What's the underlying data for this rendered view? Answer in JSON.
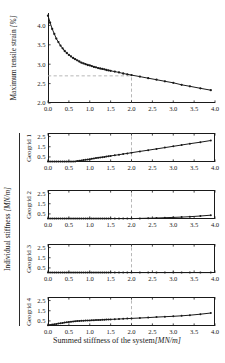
{
  "colors": {
    "axis": "#1a1a1a",
    "line": "#1a1a1a",
    "dash": "#b0b0b0",
    "text": "#1a1a1a",
    "bg": "#ffffff"
  },
  "labels": {
    "top_ylabel_text": "Maximum tensile strain ",
    "top_ylabel_unit": "[%]",
    "group_ylabel_text": "Individual stiffness ",
    "group_ylabel_unit": "[MN/m]",
    "xlabel_text": "Summed stiffness of the system",
    "xlabel_unit": "[MN/m]"
  },
  "chart_data": [
    {
      "id": "max-tensile-strain",
      "type": "line",
      "title": "",
      "xlabel": "Summed stiffness of the system [MN/m]",
      "ylabel": "Maximum tensile strain [%]",
      "xlim": [
        0.0,
        4.0
      ],
      "ylim": [
        2.0,
        4.32
      ],
      "xticks": [
        0.0,
        0.5,
        1.0,
        1.5,
        2.0,
        2.5,
        3.0,
        3.5,
        4.0
      ],
      "yticks": [
        2.0,
        2.5,
        3.0,
        3.5,
        4.0
      ],
      "grid": false,
      "legend": "none",
      "box": false,
      "marker_r": 1.15,
      "ref_x": 2.0,
      "ref_y": 2.7,
      "x": [
        0,
        0.05,
        0.1,
        0.15,
        0.2,
        0.25,
        0.3,
        0.35,
        0.4,
        0.45,
        0.5,
        0.55,
        0.6,
        0.65,
        0.7,
        0.75,
        0.8,
        0.85,
        0.9,
        0.95,
        1,
        1.05,
        1.1,
        1.15,
        1.2,
        1.25,
        1.3,
        1.35,
        1.4,
        1.45,
        1.5,
        1.6,
        1.7,
        1.8,
        1.9,
        2,
        2.2,
        2.4,
        2.6,
        2.8,
        3,
        3.2,
        3.4,
        3.65,
        3.9
      ],
      "values": [
        4.25,
        4.07,
        3.91,
        3.78,
        3.66,
        3.57,
        3.48,
        3.41,
        3.34,
        3.29,
        3.24,
        3.2,
        3.16,
        3.13,
        3.1,
        3.07,
        3.04,
        3.02,
        3.0,
        2.98,
        2.97,
        2.95,
        2.93,
        2.92,
        2.9,
        2.89,
        2.88,
        2.87,
        2.85,
        2.84,
        2.83,
        2.81,
        2.79,
        2.76,
        2.74,
        2.72,
        2.68,
        2.64,
        2.6,
        2.56,
        2.52,
        2.47,
        2.43,
        2.38,
        2.33
      ]
    },
    {
      "id": "geogrid-1",
      "type": "line",
      "panel_label": "Geogrid 1",
      "xlim": [
        0.0,
        4.0
      ],
      "ylim": [
        0.0,
        2.85
      ],
      "xticks": [
        0.0,
        0.5,
        1.0,
        1.5,
        2.0,
        2.5,
        3.0,
        3.5,
        4.0
      ],
      "yticks": [
        0.5,
        1.5,
        2.5
      ],
      "grid": false,
      "box": true,
      "marker_r": 1.0,
      "ref_x": 2.0,
      "x": [
        0,
        0.05,
        0.1,
        0.15,
        0.2,
        0.25,
        0.3,
        0.35,
        0.4,
        0.45,
        0.5,
        0.55,
        0.6,
        0.65,
        0.7,
        0.75,
        0.8,
        0.85,
        0.9,
        0.95,
        1,
        1.05,
        1.1,
        1.15,
        1.2,
        1.25,
        1.3,
        1.35,
        1.4,
        1.45,
        1.5,
        1.6,
        1.7,
        1.8,
        1.9,
        2,
        2.2,
        2.4,
        2.6,
        2.8,
        3,
        3.2,
        3.4,
        3.65,
        3.9
      ],
      "values": [
        0.04,
        0.04,
        0.04,
        0.04,
        0.04,
        0.04,
        0.04,
        0.04,
        0.04,
        0.04,
        0.04,
        0.04,
        0.04,
        0.06,
        0.09,
        0.12,
        0.16,
        0.19,
        0.22,
        0.25,
        0.28,
        0.31,
        0.35,
        0.38,
        0.41,
        0.44,
        0.47,
        0.5,
        0.53,
        0.57,
        0.6,
        0.66,
        0.72,
        0.79,
        0.85,
        0.91,
        1.04,
        1.16,
        1.29,
        1.42,
        1.54,
        1.67,
        1.8,
        1.95,
        2.11
      ]
    },
    {
      "id": "geogrid-2",
      "type": "line",
      "panel_label": "Geogrid 2",
      "xlim": [
        0.0,
        4.0
      ],
      "ylim": [
        0.0,
        2.85
      ],
      "xticks": [
        0.0,
        0.5,
        1.0,
        1.5,
        2.0,
        2.5,
        3.0,
        3.5,
        4.0
      ],
      "yticks": [
        0.5,
        1.5,
        2.5
      ],
      "grid": false,
      "box": true,
      "marker_r": 1.0,
      "ref_x": 2.0,
      "x": [
        0,
        0.05,
        0.1,
        0.15,
        0.2,
        0.25,
        0.3,
        0.35,
        0.4,
        0.45,
        0.5,
        0.55,
        0.6,
        0.65,
        0.7,
        0.75,
        0.8,
        0.85,
        0.9,
        0.95,
        1,
        1.05,
        1.1,
        1.15,
        1.2,
        1.25,
        1.3,
        1.35,
        1.4,
        1.45,
        1.5,
        1.6,
        1.7,
        1.8,
        1.9,
        2,
        2.2,
        2.4,
        2.6,
        2.8,
        3,
        3.2,
        3.4,
        3.65,
        3.9
      ],
      "values": [
        0.04,
        0.04,
        0.04,
        0.04,
        0.04,
        0.04,
        0.04,
        0.04,
        0.04,
        0.04,
        0.04,
        0.04,
        0.04,
        0.04,
        0.04,
        0.04,
        0.04,
        0.04,
        0.04,
        0.04,
        0.04,
        0.04,
        0.04,
        0.04,
        0.04,
        0.04,
        0.04,
        0.04,
        0.04,
        0.04,
        0.04,
        0.04,
        0.04,
        0.04,
        0.04,
        0.04,
        0.06,
        0.08,
        0.1,
        0.13,
        0.16,
        0.19,
        0.23,
        0.29,
        0.37
      ]
    },
    {
      "id": "geogrid-3",
      "type": "line",
      "panel_label": "Geogrid 3",
      "xlim": [
        0.0,
        4.0
      ],
      "ylim": [
        0.0,
        2.85
      ],
      "xticks": [
        0.0,
        0.5,
        1.0,
        1.5,
        2.0,
        2.5,
        3.0,
        3.5,
        4.0
      ],
      "yticks": [
        0.5,
        1.5,
        2.5
      ],
      "grid": false,
      "box": true,
      "marker_r": 1.0,
      "ref_x": 2.0,
      "x": [
        0,
        0.05,
        0.1,
        0.15,
        0.2,
        0.25,
        0.3,
        0.35,
        0.4,
        0.45,
        0.5,
        0.55,
        0.6,
        0.65,
        0.7,
        0.75,
        0.8,
        0.85,
        0.9,
        0.95,
        1,
        1.05,
        1.1,
        1.15,
        1.2,
        1.25,
        1.3,
        1.35,
        1.4,
        1.45,
        1.5,
        1.6,
        1.7,
        1.8,
        1.9,
        2,
        2.2,
        2.4,
        2.6,
        2.8,
        3,
        3.2,
        3.4,
        3.65,
        3.9
      ],
      "values": [
        0.04,
        0.04,
        0.04,
        0.04,
        0.04,
        0.04,
        0.04,
        0.04,
        0.04,
        0.04,
        0.04,
        0.04,
        0.04,
        0.04,
        0.04,
        0.04,
        0.04,
        0.04,
        0.04,
        0.04,
        0.04,
        0.04,
        0.04,
        0.04,
        0.04,
        0.04,
        0.04,
        0.04,
        0.04,
        0.04,
        0.04,
        0.04,
        0.04,
        0.04,
        0.04,
        0.04,
        0.04,
        0.04,
        0.04,
        0.04,
        0.04,
        0.04,
        0.04,
        0.04,
        0.04
      ]
    },
    {
      "id": "geogrid-4",
      "type": "line",
      "panel_label": "Geogrid 4",
      "xlim": [
        0.0,
        4.0
      ],
      "ylim": [
        0.0,
        2.85
      ],
      "xticks": [
        0.0,
        0.5,
        1.0,
        1.5,
        2.0,
        2.5,
        3.0,
        3.5,
        4.0
      ],
      "yticks": [
        0.5,
        1.5,
        2.5
      ],
      "grid": false,
      "box": true,
      "marker_r": 1.0,
      "ref_x": 2.0,
      "x": [
        0,
        0.05,
        0.1,
        0.15,
        0.2,
        0.25,
        0.3,
        0.35,
        0.4,
        0.45,
        0.5,
        0.55,
        0.6,
        0.65,
        0.7,
        0.75,
        0.8,
        0.85,
        0.9,
        0.95,
        1,
        1.05,
        1.1,
        1.15,
        1.2,
        1.25,
        1.3,
        1.35,
        1.4,
        1.45,
        1.5,
        1.6,
        1.7,
        1.8,
        1.9,
        2,
        2.2,
        2.4,
        2.6,
        2.8,
        3,
        3.2,
        3.4,
        3.65,
        3.9
      ],
      "values": [
        0.08,
        0.11,
        0.14,
        0.17,
        0.2,
        0.24,
        0.27,
        0.3,
        0.33,
        0.36,
        0.39,
        0.42,
        0.44,
        0.46,
        0.48,
        0.5,
        0.51,
        0.52,
        0.53,
        0.54,
        0.55,
        0.56,
        0.57,
        0.58,
        0.59,
        0.6,
        0.61,
        0.62,
        0.63,
        0.64,
        0.65,
        0.67,
        0.69,
        0.71,
        0.73,
        0.75,
        0.79,
        0.83,
        0.87,
        0.91,
        0.95,
        1.0,
        1.06,
        1.16,
        1.28
      ]
    }
  ]
}
